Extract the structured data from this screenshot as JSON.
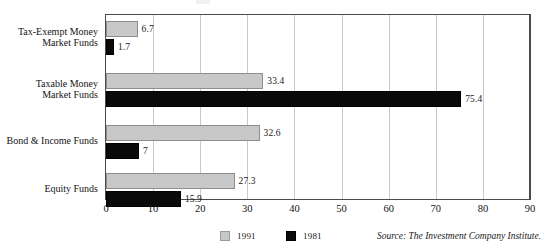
{
  "chart_data": {
    "type": "bar",
    "orientation": "horizontal",
    "title": "",
    "subtitle": "",
    "xlabel": "",
    "ylabel": "",
    "xlim": [
      0,
      90
    ],
    "xticks": [
      0,
      10,
      20,
      30,
      40,
      50,
      60,
      70,
      80,
      90
    ],
    "xtick_labels": [
      "0",
      "10",
      "20",
      "30",
      "40",
      "50",
      "60",
      "70",
      "80",
      "90"
    ],
    "grid": "vertical",
    "legend_position": "bottom",
    "categories": [
      "Tax-Exempt Money\nMarket Funds",
      "Taxable Money\nMarket Funds",
      "Bond & Income Funds",
      "Equity Funds"
    ],
    "series": [
      {
        "name": "1991",
        "color": "#c8c8c8",
        "values": [
          6.7,
          33.4,
          32.6,
          27.3
        ],
        "value_labels": [
          "6.7",
          "33.4",
          "32.6",
          "27.3"
        ]
      },
      {
        "name": "1981",
        "color": "#0a0a0a",
        "values": [
          1.7,
          75.4,
          7,
          15.9
        ],
        "value_labels": [
          "1.7",
          "75.4",
          "7",
          "15.9"
        ]
      }
    ],
    "annotations": [
      "Source: The Investment Company Institute."
    ]
  },
  "legend": {
    "items": [
      {
        "label": "1991",
        "swatch": "gray-swatch-icon"
      },
      {
        "label": "1981",
        "swatch": "black-swatch-icon"
      }
    ]
  },
  "source": {
    "text": "Source: The Investment Company Institute."
  },
  "colors": {
    "series_1991": "#c8c8c8",
    "series_1981": "#0a0a0a",
    "frame": "#4a4a4a",
    "gridline": "#c9c9c9",
    "background": "#ffffff",
    "text": "#141414"
  }
}
